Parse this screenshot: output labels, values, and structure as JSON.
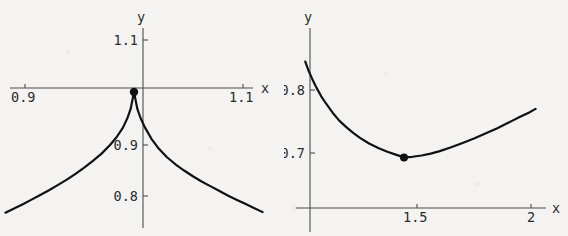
{
  "figure": {
    "background_color": "#f4f3f1",
    "curve_color": "#111111",
    "axis_color": "#4c4c4c",
    "width": 568,
    "height": 236
  },
  "chart_data": [
    {
      "id": "left-plot",
      "type": "line",
      "title": "",
      "xlabel": "x",
      "ylabel": "y",
      "grid": false,
      "legend": null,
      "xlim": [
        0.88,
        1.12
      ],
      "ylim": [
        0.74,
        1.12
      ],
      "xticks": [
        0.9,
        1.1
      ],
      "xtick_labels": [
        "0.9",
        "1.1"
      ],
      "yticks": [
        0.8,
        0.9,
        1.1
      ],
      "ytick_labels": [
        "0.8",
        "0.9",
        "1.1"
      ],
      "annotations": [
        {
          "name": "cusp-point",
          "x": 1.0,
          "y": 1.0,
          "style": "dot"
        }
      ],
      "description": "Symmetric cusp peaking at (1, 1) and decaying on both sides",
      "x": [
        0.882,
        0.89,
        0.898,
        0.906,
        0.914,
        0.922,
        0.93,
        0.938,
        0.946,
        0.954,
        0.962,
        0.97,
        0.978,
        0.984,
        0.99,
        0.994,
        0.997,
        1.0,
        1.003,
        1.006,
        1.01,
        1.016,
        1.022,
        1.03,
        1.038,
        1.046,
        1.054,
        1.062,
        1.07,
        1.078,
        1.086,
        1.094,
        1.102,
        1.11,
        1.118
      ],
      "y": [
        0.768,
        0.776,
        0.784,
        0.793,
        0.802,
        0.811,
        0.821,
        0.831,
        0.842,
        0.854,
        0.867,
        0.881,
        0.898,
        0.913,
        0.932,
        0.95,
        0.968,
        1.0,
        0.968,
        0.95,
        0.932,
        0.91,
        0.893,
        0.875,
        0.861,
        0.849,
        0.838,
        0.828,
        0.819,
        0.81,
        0.801,
        0.793,
        0.785,
        0.777,
        0.769
      ]
    },
    {
      "id": "right-plot",
      "type": "line",
      "title": "",
      "xlabel": "x",
      "ylabel": "y",
      "grid": false,
      "legend": null,
      "xlim": [
        1.0,
        2.06
      ],
      "ylim": [
        0.62,
        0.855
      ],
      "xticks": [
        1.5,
        2.0
      ],
      "xtick_labels": [
        "1.5",
        "2"
      ],
      "yticks": [
        0.7,
        0.8
      ],
      "ytick_labels": [
        "0.7",
        "0.8"
      ],
      "annotations": [
        {
          "name": "minimum-point",
          "x": 1.443,
          "y": 0.693,
          "style": "dot"
        }
      ],
      "description": "Convex curve falling steeply from upper left to a minimum near x = 1.44, y = 0.693, then rising to the right",
      "x": [
        1.01,
        1.025,
        1.04,
        1.06,
        1.08,
        1.1,
        1.13,
        1.16,
        1.19,
        1.22,
        1.25,
        1.29,
        1.33,
        1.37,
        1.41,
        1.443,
        1.48,
        1.52,
        1.56,
        1.6,
        1.65,
        1.7,
        1.75,
        1.8,
        1.85,
        1.9,
        1.95,
        1.99,
        2.02
      ],
      "y": [
        0.845,
        0.83,
        0.818,
        0.803,
        0.79,
        0.779,
        0.764,
        0.751,
        0.741,
        0.732,
        0.724,
        0.715,
        0.708,
        0.702,
        0.697,
        0.693,
        0.694,
        0.696,
        0.699,
        0.703,
        0.709,
        0.716,
        0.723,
        0.731,
        0.739,
        0.748,
        0.757,
        0.764,
        0.77
      ]
    }
  ]
}
